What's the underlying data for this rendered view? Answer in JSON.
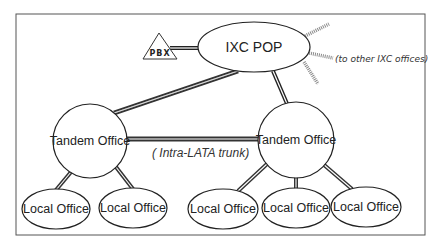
{
  "diagram": {
    "frame": {
      "x": 16,
      "y": 14,
      "width": 409,
      "height": 221,
      "stroke": "#555555"
    },
    "colors": {
      "stroke": "#222222",
      "link_light": "#ffffff",
      "hatched": "#888888",
      "text": "#222222"
    },
    "nodes": {
      "pbx": {
        "label": "PBX",
        "shape": "triangle",
        "points": "159,33 143,59 177,59",
        "lx": 160,
        "ly": 55
      },
      "ixc_pop": {
        "label": "IXC POP",
        "shape": "ellipse",
        "cx": 254,
        "cy": 47,
        "rx": 56,
        "ry": 25
      },
      "tandem_left": {
        "label": "Tandem Office",
        "shape": "circle",
        "cx": 90,
        "cy": 141,
        "r": 37
      },
      "tandem_right": {
        "label": "Tandem Office",
        "shape": "circle",
        "cx": 296,
        "cy": 140,
        "r": 38
      },
      "local_1": {
        "label": "Local Office",
        "cx": 56,
        "cy": 209,
        "rx": 34,
        "ry": 20
      },
      "local_2": {
        "label": "Local Office",
        "cx": 133,
        "cy": 208,
        "rx": 34,
        "ry": 20
      },
      "local_3": {
        "label": "Local Office",
        "cx": 223,
        "cy": 209,
        "rx": 35,
        "ry": 20
      },
      "local_4": {
        "label": "Local Office",
        "cx": 296,
        "cy": 208,
        "rx": 34,
        "ry": 20
      },
      "local_5": {
        "label": "Local Office",
        "cx": 366,
        "cy": 207,
        "rx": 35,
        "ry": 20
      }
    },
    "annotations": {
      "other_ixc": "(to other IXC offices)",
      "intra_lata": "( Intra-LATA trunk)"
    }
  }
}
